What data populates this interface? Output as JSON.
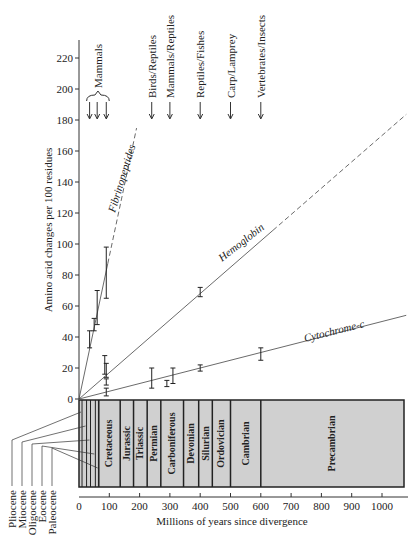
{
  "chart_data": {
    "type": "line",
    "title": "",
    "xlabel": "Millions of years since divergence",
    "ylabel": "Amino acid changes per 100 residues",
    "xlim": [
      0,
      1080
    ],
    "ylim": [
      0,
      230
    ],
    "x_ticks": [
      0,
      100,
      200,
      300,
      400,
      500,
      600,
      700,
      800,
      900,
      1000
    ],
    "y_ticks": [
      0,
      20,
      40,
      60,
      80,
      100,
      120,
      140,
      160,
      180,
      200,
      220
    ],
    "grid": false,
    "legend": "inline labels on lines",
    "series": [
      {
        "name": "Fibrinopeptides",
        "line": {
          "slope_per_100my": 92,
          "solid_to_x": 95,
          "dashed_to_x": 190
        },
        "points": [
          {
            "x": 35,
            "y": 38,
            "low": 33,
            "high": 44
          },
          {
            "x": 50,
            "y": 48,
            "low": 44,
            "high": 52
          },
          {
            "x": 60,
            "y": 58,
            "low": 48,
            "high": 70
          },
          {
            "x": 90,
            "y": 82,
            "low": 65,
            "high": 98
          }
        ]
      },
      {
        "name": "Hemoglobin",
        "line": {
          "slope_per_100my": 17,
          "solid_to_x": 640,
          "dashed_to_x": 1080
        },
        "points": [
          {
            "x": 85,
            "y": 22,
            "low": 16,
            "high": 28
          },
          {
            "x": 90,
            "y": 18,
            "low": 14,
            "high": 23
          },
          {
            "x": 400,
            "y": 69,
            "low": 66,
            "high": 72
          }
        ]
      },
      {
        "name": "Cytochrome-c",
        "line": {
          "slope_per_100my": 5,
          "solid_to_x": 1080,
          "dashed_to_x": 1080
        },
        "points": [
          {
            "x": 90,
            "y": 5,
            "low": 2,
            "high": 7
          },
          {
            "x": 90,
            "y": 11,
            "low": 9,
            "high": 13
          },
          {
            "x": 240,
            "y": 12,
            "low": 7,
            "high": 20
          },
          {
            "x": 290,
            "y": 10,
            "low": 8,
            "high": 12
          },
          {
            "x": 310,
            "y": 15,
            "low": 10,
            "high": 20
          },
          {
            "x": 400,
            "y": 20,
            "low": 18,
            "high": 22
          },
          {
            "x": 600,
            "y": 29,
            "low": 25,
            "high": 33
          }
        ]
      }
    ],
    "annotations": [
      {
        "label": "Mammals",
        "x": [
          35,
          60,
          90
        ],
        "group_brace": true
      },
      {
        "label": "Birds/Reptiles",
        "x": 240
      },
      {
        "label": "Mammals/Reptiles",
        "x": 300
      },
      {
        "label": "Reptiles/Fishes",
        "x": 400
      },
      {
        "label": "Carp/Lamprey",
        "x": 500
      },
      {
        "label": "Vertebrates/Insects",
        "x": 600
      }
    ],
    "geologic_periods": [
      {
        "name": "Cretaceous",
        "start": 65,
        "end": 136
      },
      {
        "name": "Jurassic",
        "start": 136,
        "end": 180
      },
      {
        "name": "Triassic",
        "start": 180,
        "end": 225
      },
      {
        "name": "Permian",
        "start": 225,
        "end": 270
      },
      {
        "name": "Carboniferous",
        "start": 270,
        "end": 345
      },
      {
        "name": "Devonian",
        "start": 345,
        "end": 395
      },
      {
        "name": "Silurian",
        "start": 395,
        "end": 440
      },
      {
        "name": "Ordovician",
        "start": 440,
        "end": 500
      },
      {
        "name": "Cambrian",
        "start": 500,
        "end": 600
      },
      {
        "name": "Precambrian",
        "start": 600,
        "end": 1070
      }
    ],
    "epochs": [
      {
        "name": "Pliocene",
        "end": 10
      },
      {
        "name": "Miocene",
        "end": 25
      },
      {
        "name": "Oligocene",
        "end": 38
      },
      {
        "name": "Eocene",
        "end": 54
      },
      {
        "name": "Paleocene",
        "end": 65
      }
    ]
  }
}
